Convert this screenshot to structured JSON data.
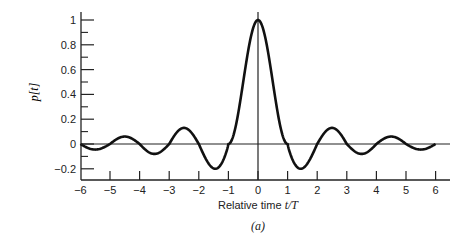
{
  "chart_data": {
    "type": "line",
    "title": "",
    "xlabel": "Relative time t/T",
    "xlabel_prefix": "Relative time ",
    "xlabel_var": "t/T",
    "ylabel": "p[t]",
    "caption": "(a)",
    "xlim": [
      -6,
      6
    ],
    "ylim": [
      -0.28,
      1.05
    ],
    "x_ticks": [
      -6,
      -5,
      -4,
      -3,
      -2,
      -1,
      0,
      1,
      2,
      3,
      4,
      5,
      6
    ],
    "x_tick_labels": [
      "−6",
      "−5",
      "−4",
      "−3",
      "−2",
      "−1",
      "0",
      "1",
      "2",
      "3",
      "4",
      "5",
      "6"
    ],
    "y_ticks": [
      -0.2,
      0,
      0.2,
      0.4,
      0.6,
      0.8,
      1
    ],
    "y_tick_labels": [
      "−0.2",
      "0",
      "0.2",
      "0.4",
      "0.6",
      "0.8",
      "1"
    ],
    "y_minor_ticks": [
      -0.1,
      0.1,
      0.3,
      0.5,
      0.7,
      0.9
    ],
    "grid": false,
    "legend": null,
    "series": [
      {
        "name": "p[t]",
        "x": [
          -6,
          -5.5,
          -5,
          -4.5,
          -4,
          -3.5,
          -3,
          -2.5,
          -2,
          -1.5,
          -1.4,
          -1,
          -0.5,
          0,
          0.5,
          1,
          1.4,
          1.5,
          2,
          2.5,
          3,
          3.5,
          4,
          4.5,
          5,
          5.5,
          6
        ],
        "y": [
          0,
          -0.045,
          0,
          0.06,
          0,
          -0.08,
          0,
          0.13,
          0,
          -0.19,
          -0.2,
          0,
          0.6,
          1,
          0.6,
          0,
          -0.2,
          -0.19,
          0,
          0.13,
          0,
          -0.08,
          0,
          0.06,
          0,
          -0.045,
          0
        ]
      }
    ]
  }
}
